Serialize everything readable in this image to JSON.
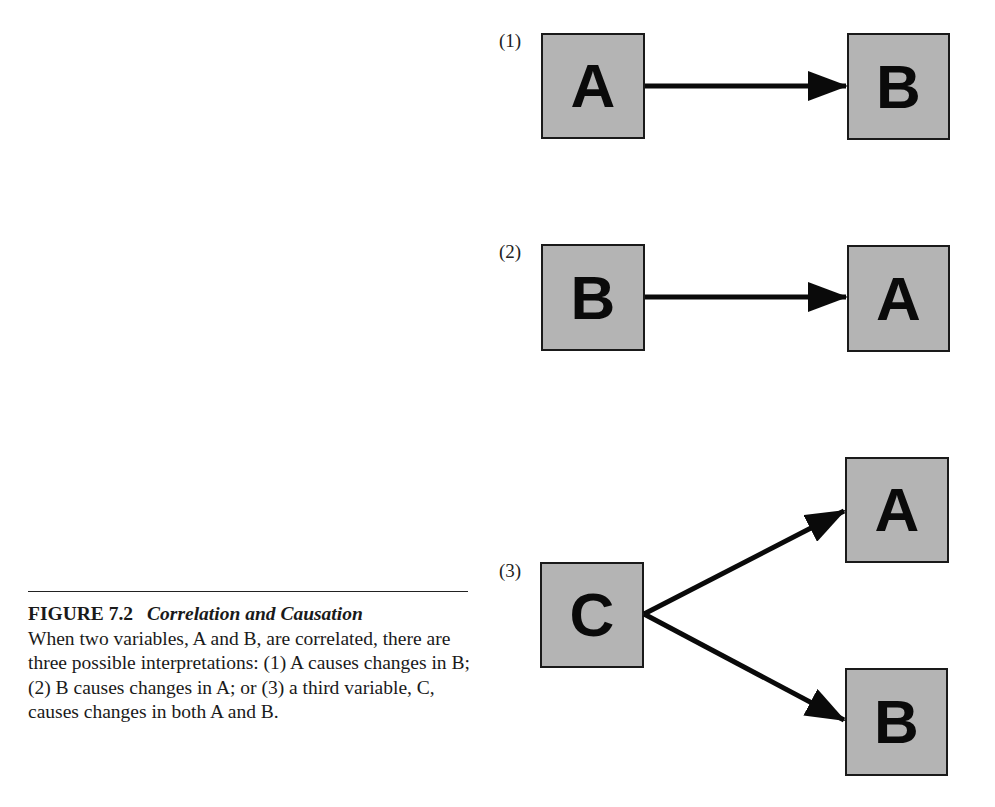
{
  "diagram": {
    "panels": [
      {
        "label": "(1)",
        "nodes": [
          {
            "id": "A",
            "text": "A"
          },
          {
            "id": "B",
            "text": "B"
          }
        ],
        "edges": [
          {
            "from": "A",
            "to": "B"
          }
        ]
      },
      {
        "label": "(2)",
        "nodes": [
          {
            "id": "B",
            "text": "B"
          },
          {
            "id": "A",
            "text": "A"
          }
        ],
        "edges": [
          {
            "from": "B",
            "to": "A"
          }
        ]
      },
      {
        "label": "(3)",
        "nodes": [
          {
            "id": "C",
            "text": "C"
          },
          {
            "id": "A",
            "text": "A"
          },
          {
            "id": "B",
            "text": "B"
          }
        ],
        "edges": [
          {
            "from": "C",
            "to": "A"
          },
          {
            "from": "C",
            "to": "B"
          }
        ]
      }
    ],
    "colors": {
      "box_fill": "#b4b4b4",
      "box_border": "#1a1a1a",
      "arrow": "#0a0a0a"
    }
  },
  "caption": {
    "figure_number": "FIGURE 7.2",
    "title": "Correlation and Causation",
    "body": "When two variables, A and B, are correlated, there are three possible interpretations: (1) A causes changes in B; (2) B causes changes in A; or (3) a third variable, C, causes changes in both A and B."
  }
}
